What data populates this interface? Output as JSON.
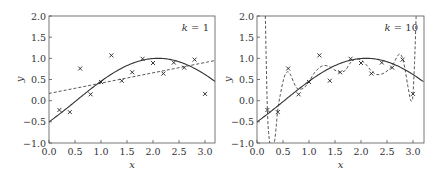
{
  "chart_data": [
    {
      "type": "line",
      "title": "",
      "annotation": "k = 1",
      "annotation_parts": {
        "var": "k",
        "op": " = ",
        "value": "1"
      },
      "xlabel": "x",
      "ylabel": "y",
      "xlim": [
        0.0,
        3.2
      ],
      "ylim": [
        -1.0,
        2.0
      ],
      "xticks": [
        "0.0",
        "0.5",
        "1.0",
        "1.5",
        "2.0",
        "2.5",
        "3.0"
      ],
      "yticks": [
        "-1.0",
        "-0.5",
        "0.0",
        "0.5",
        "1.0",
        "1.5",
        "2.0"
      ],
      "grid": false,
      "legend": null,
      "series": [
        {
          "name": "true function",
          "style": "solid",
          "function": "sin(x - pi/6)",
          "x": [
            0.0,
            0.2,
            0.4,
            0.6,
            0.8,
            1.0,
            1.2,
            1.4,
            1.6,
            1.8,
            2.0,
            2.2,
            2.4,
            2.6,
            2.8,
            3.0,
            3.2
          ],
          "values": [
            -0.5,
            -0.31,
            -0.12,
            0.08,
            0.27,
            0.45,
            0.61,
            0.75,
            0.87,
            0.95,
            0.99,
            1.0,
            0.97,
            0.9,
            0.8,
            0.67,
            0.51
          ]
        },
        {
          "name": "polynomial fit k=1",
          "style": "dashed",
          "x": [
            0.0,
            3.2
          ],
          "values": [
            0.17,
            0.95
          ]
        },
        {
          "name": "samples",
          "style": "markers-x",
          "x": [
            0.2,
            0.4,
            0.6,
            0.8,
            1.0,
            1.2,
            1.4,
            1.6,
            1.8,
            2.0,
            2.2,
            2.4,
            2.6,
            2.8,
            3.0
          ],
          "values": [
            -0.22,
            -0.27,
            0.76,
            0.15,
            0.44,
            1.07,
            0.47,
            0.67,
            0.99,
            0.89,
            0.64,
            0.9,
            0.78,
            0.97,
            0.16
          ]
        }
      ]
    },
    {
      "type": "line",
      "title": "",
      "annotation": "k = 10",
      "annotation_parts": {
        "var": "k",
        "op": " = ",
        "value": "10"
      },
      "xlabel": "x",
      "ylabel": "y",
      "xlim": [
        0.0,
        3.2
      ],
      "ylim": [
        -1.0,
        2.0
      ],
      "xticks": [
        "0.0",
        "0.5",
        "1.0",
        "1.5",
        "2.0",
        "2.5",
        "3.0"
      ],
      "yticks": [
        "-1.0",
        "-0.5",
        "0.0",
        "0.5",
        "1.0",
        "1.5",
        "2.0"
      ],
      "grid": false,
      "legend": null,
      "series": [
        {
          "name": "true function",
          "style": "solid",
          "function": "sin(x - pi/6)",
          "x": [
            0.0,
            0.2,
            0.4,
            0.6,
            0.8,
            1.0,
            1.2,
            1.4,
            1.6,
            1.8,
            2.0,
            2.2,
            2.4,
            2.6,
            2.8,
            3.0,
            3.2
          ],
          "values": [
            -0.5,
            -0.31,
            -0.12,
            0.08,
            0.27,
            0.45,
            0.61,
            0.75,
            0.87,
            0.95,
            0.99,
            1.0,
            0.97,
            0.9,
            0.8,
            0.67,
            0.51
          ]
        },
        {
          "name": "polynomial fit k=10",
          "style": "dashed",
          "x": [
            0.16,
            0.2,
            0.24,
            0.27,
            0.33,
            0.37,
            0.4,
            0.45,
            0.5,
            0.55,
            0.6,
            0.65,
            0.7,
            0.75,
            0.8,
            0.9,
            1.0,
            1.1,
            1.2,
            1.3,
            1.4,
            1.5,
            1.6,
            1.7,
            1.8,
            1.9,
            2.0,
            2.1,
            2.2,
            2.3,
            2.4,
            2.5,
            2.6,
            2.7,
            2.75,
            2.8,
            2.85,
            2.9,
            2.95,
            2.98,
            3.0,
            3.03,
            3.06
          ],
          "values": [
            2.0,
            -0.22,
            -0.95,
            -1.0,
            -1.0,
            -0.6,
            -0.2,
            0.15,
            0.45,
            0.64,
            0.68,
            0.6,
            0.45,
            0.32,
            0.27,
            0.3,
            0.45,
            0.65,
            0.78,
            0.83,
            0.8,
            0.72,
            0.67,
            0.72,
            0.9,
            0.98,
            0.96,
            0.85,
            0.7,
            0.62,
            0.63,
            0.7,
            0.82,
            1.05,
            1.1,
            1.0,
            0.72,
            0.35,
            0.03,
            0.0,
            0.15,
            0.9,
            2.0
          ]
        },
        {
          "name": "samples",
          "style": "markers-x",
          "x": [
            0.2,
            0.4,
            0.6,
            0.8,
            1.0,
            1.2,
            1.4,
            1.6,
            1.8,
            2.0,
            2.2,
            2.4,
            2.6,
            2.8,
            3.0
          ],
          "values": [
            -0.22,
            -0.27,
            0.76,
            0.15,
            0.44,
            1.07,
            0.47,
            0.67,
            0.99,
            0.89,
            0.64,
            0.9,
            0.78,
            0.97,
            0.16
          ]
        }
      ]
    }
  ],
  "panels": [
    {
      "frame": {
        "left": 49,
        "top": 16,
        "right": 215,
        "bottom": 143
      },
      "x0_px": 49,
      "x3_px": 205
    },
    {
      "frame": {
        "left": 257,
        "top": 16,
        "right": 424,
        "bottom": 143
      },
      "x0_px": 257,
      "x3_px": 413
    }
  ]
}
